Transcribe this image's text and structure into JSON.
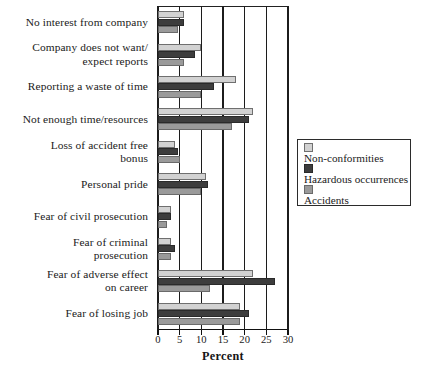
{
  "chart_data": {
    "type": "bar",
    "orientation": "horizontal",
    "title": "",
    "xlabel": "Percent",
    "ylabel": "",
    "xlim": [
      0,
      30
    ],
    "xticks": [
      0,
      5,
      10,
      15,
      20,
      25,
      30
    ],
    "grid": "vertical gridlines at each 5 percent tick",
    "legend_position": "right",
    "categories": [
      "No interest from company",
      "Company does not want/ expect reports",
      "Reporting a waste of time",
      "Not enough time/resources",
      "Loss of accident free bonus",
      "Personal pride",
      "Fear of civil prosecution",
      "Fear of criminal prosecution",
      "Fear of adverse effect on career",
      "Fear of losing job"
    ],
    "series": [
      {
        "name": "Non-conformities",
        "color": "#d2d2d2",
        "values": [
          6,
          10,
          18,
          22,
          4,
          11,
          3,
          3,
          22,
          19
        ]
      },
      {
        "name": "Hazardous occurrences",
        "color": "#3d3d3d",
        "values": [
          6,
          8.5,
          13,
          21,
          4.5,
          11.5,
          3,
          4,
          27,
          21
        ]
      },
      {
        "name": "Accidents",
        "color": "#9a9a9a",
        "values": [
          4.5,
          6,
          10,
          17,
          5,
          10,
          2,
          3,
          12,
          19
        ]
      }
    ]
  },
  "category_label_lines": [
    [
      "No interest from company"
    ],
    [
      "Company does not want/",
      "expect reports"
    ],
    [
      "Reporting a waste of time"
    ],
    [
      "Not enough time/resources"
    ],
    [
      "Loss of accident free",
      "bonus"
    ],
    [
      "Personal pride"
    ],
    [
      "Fear of civil prosecution"
    ],
    [
      "Fear of criminal",
      "prosecution"
    ],
    [
      "Fear of adverse effect",
      "on career"
    ],
    [
      "Fear of losing job"
    ]
  ],
  "axis": {
    "title": "Percent",
    "tick_labels": [
      "0",
      "5",
      "10",
      "15",
      "20",
      "25",
      "30"
    ]
  },
  "legend": {
    "entries": [
      {
        "label": "Non-conformities",
        "color": "#d2d2d2"
      },
      {
        "label": "Hazardous occurrences",
        "color": "#3d3d3d"
      },
      {
        "label": "Accidents",
        "color": "#9a9a9a"
      }
    ]
  }
}
